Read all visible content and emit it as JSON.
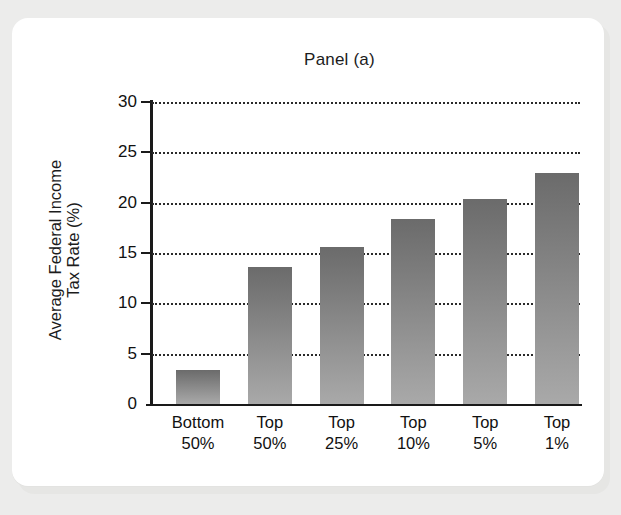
{
  "chart_data": {
    "type": "bar",
    "title": "Panel (a)",
    "xlabel": "",
    "ylabel_line1": "Average Federal Income",
    "ylabel_line2": "Tax Rate (%)",
    "categories": [
      "Bottom 50%",
      "Top 50%",
      "Top 25%",
      "Top 10%",
      "Top 5%",
      "Top 1%"
    ],
    "category_lines": [
      {
        "line1": "Bottom",
        "line2": "50%"
      },
      {
        "line1": "Top",
        "line2": "50%"
      },
      {
        "line1": "Top",
        "line2": "25%"
      },
      {
        "line1": "Top",
        "line2": "10%"
      },
      {
        "line1": "Top",
        "line2": "5%"
      },
      {
        "line1": "Top",
        "line2": "1%"
      }
    ],
    "values": [
      3.4,
      13.6,
      15.6,
      18.4,
      20.4,
      22.9
    ],
    "ylim": [
      0,
      30
    ],
    "yticks": [
      0,
      5,
      10,
      15,
      20,
      25,
      30
    ],
    "ytick_labels": [
      "0",
      "5",
      "10",
      "15",
      "20",
      "25",
      "30"
    ],
    "grid": "horizontal-dotted",
    "legend": "none",
    "bar_color_top": "#6b6b6b",
    "bar_color_bottom": "#a9a9a9",
    "axis_color": "#1a1a1a",
    "background": "#ffffff"
  }
}
